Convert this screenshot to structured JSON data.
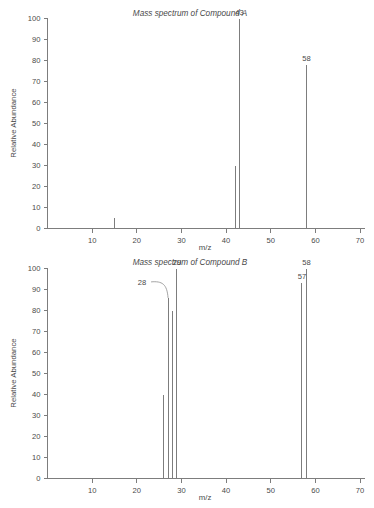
{
  "figure": {
    "background_color": "#ffffff",
    "line_color": "#7d7d7d",
    "text_color": "#4a4a4a"
  },
  "panels": [
    {
      "id": "compound-a",
      "title": "Mass spectrum of Compound A",
      "xlabel": "m/z",
      "ylabel": "Relative Abundance"
    },
    {
      "id": "compound-b",
      "title": "Mass spectrum of Compound B",
      "xlabel": "m/z",
      "ylabel": "Relative Abundance"
    }
  ],
  "axes": {
    "x_ticks": [
      10,
      20,
      30,
      40,
      50,
      60,
      70
    ],
    "x_tick_labels": [
      "10",
      "20",
      "30",
      "40",
      "50",
      "60",
      "70"
    ],
    "y_ticks": [
      0,
      10,
      20,
      30,
      40,
      50,
      60,
      70,
      80,
      90,
      100
    ],
    "y_tick_labels": [
      "0",
      "10",
      "20",
      "30",
      "40",
      "50",
      "60",
      "70",
      "80",
      "90",
      "100"
    ],
    "xlim": [
      0,
      71
    ],
    "ylim": [
      0,
      100
    ]
  },
  "chart_data": [
    {
      "type": "bar",
      "id": "compound-a",
      "title": "Mass spectrum of Compound A",
      "xlabel": "m/z",
      "ylabel": "Relative Abundance",
      "xlim": [
        0,
        71
      ],
      "ylim": [
        0,
        100
      ],
      "grid": false,
      "legend": "none",
      "x": [
        15,
        42,
        43,
        58
      ],
      "values": [
        5,
        30,
        100,
        78
      ],
      "labels": [
        null,
        null,
        "43",
        "58"
      ],
      "annotations": [
        {
          "text": "43",
          "mz": 43,
          "abundance": 100
        },
        {
          "text": "58",
          "mz": 58,
          "abundance": 78
        }
      ]
    },
    {
      "type": "bar",
      "id": "compound-b",
      "title": "Mass spectrum of Compound B",
      "xlabel": "m/z",
      "ylabel": "Relative Abundance",
      "xlim": [
        0,
        71
      ],
      "ylim": [
        0,
        100
      ],
      "grid": false,
      "legend": "none",
      "x": [
        26,
        27,
        28,
        29,
        57,
        58
      ],
      "values": [
        40,
        86,
        80,
        100,
        93,
        100
      ],
      "labels": [
        null,
        "28",
        null,
        "29",
        "57",
        "58"
      ],
      "annotations": [
        {
          "text": "28",
          "mz": 27,
          "abundance": 86,
          "leader": true
        },
        {
          "text": "29",
          "mz": 29,
          "abundance": 100
        },
        {
          "text": "57",
          "mz": 57,
          "abundance": 93
        },
        {
          "text": "58",
          "mz": 58,
          "abundance": 100
        }
      ]
    }
  ]
}
